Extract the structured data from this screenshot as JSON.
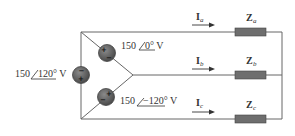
{
  "diagram": {
    "type": "three-phase delta-source to wye-load circuit",
    "sources": [
      {
        "id": "top",
        "magnitude": "150",
        "angle": "0°",
        "unit": "V",
        "label_mag": "150",
        "label_ang": "0° V"
      },
      {
        "id": "left",
        "magnitude": "150",
        "angle": "120°",
        "unit": "V",
        "label_mag": "150",
        "label_ang": "120° V"
      },
      {
        "id": "bottom",
        "magnitude": "150",
        "angle": "−120°",
        "unit": "V",
        "label_mag": "150",
        "label_ang": "−120° V"
      }
    ],
    "currents": [
      {
        "main": "I",
        "sub": "a"
      },
      {
        "main": "I",
        "sub": "b"
      },
      {
        "main": "I",
        "sub": "c"
      }
    ],
    "impedances": [
      {
        "main": "Z",
        "sub": "a"
      },
      {
        "main": "Z",
        "sub": "b"
      },
      {
        "main": "Z",
        "sub": "c"
      }
    ],
    "signs": {
      "plus": "+",
      "minus": "−"
    },
    "colors": {
      "wire": "#666666",
      "source_fill": "#5a5a5a",
      "impedance_fill": "#6e6e6e",
      "text": "#333333"
    }
  }
}
